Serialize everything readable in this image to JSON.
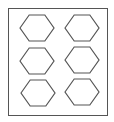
{
  "diagram": {
    "title": "",
    "stroke_color": "#555555",
    "background": "#ffffff",
    "frame": {
      "x": 8,
      "y": 8,
      "width": 99,
      "height": 107
    },
    "grid": {
      "rows": 3,
      "columns": 2
    },
    "hexagons": [
      {
        "id": "hex-r1-c1",
        "cx": 37,
        "cy": 28
      },
      {
        "id": "hex-r1-c2",
        "cx": 82,
        "cy": 28
      },
      {
        "id": "hex-r2-c1",
        "cx": 37,
        "cy": 61
      },
      {
        "id": "hex-r2-c2",
        "cx": 82,
        "cy": 60
      },
      {
        "id": "hex-r3-c1",
        "cx": 38,
        "cy": 93
      },
      {
        "id": "hex-r3-c2",
        "cx": 82,
        "cy": 92
      }
    ],
    "hexagon_size": {
      "width": 34,
      "height": 26
    }
  }
}
